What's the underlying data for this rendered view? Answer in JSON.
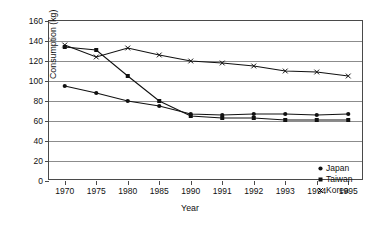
{
  "chart_data": {
    "type": "line",
    "title": "",
    "xlabel": "Year",
    "ylabel": "Consumption (kg)",
    "categories": [
      "1970",
      "1975",
      "1980",
      "1985",
      "1990",
      "1991",
      "1992",
      "1993",
      "1994",
      "1995"
    ],
    "ylim": [
      0,
      160
    ],
    "yticks": [
      0,
      20,
      40,
      60,
      80,
      100,
      120,
      140,
      160
    ],
    "grid": true,
    "legend_position": "inside-bottom-right",
    "series": [
      {
        "name": "Japan",
        "marker": "circle",
        "values": [
          95,
          88,
          80,
          75,
          67,
          66,
          67,
          67,
          66,
          67
        ]
      },
      {
        "name": "Taiwan",
        "marker": "square",
        "values": [
          134,
          131,
          105,
          80,
          65,
          63,
          63,
          61,
          61,
          61
        ]
      },
      {
        "name": "Korea",
        "marker": "cross",
        "values": [
          136,
          124,
          133,
          126,
          120,
          118,
          115,
          110,
          109,
          105
        ]
      }
    ]
  },
  "axis": {
    "y_tick_labels": [
      "0",
      "20",
      "40",
      "60",
      "80",
      "100",
      "120",
      "140",
      "160"
    ],
    "x_tick_labels": [
      "1970",
      "1975",
      "1980",
      "1985",
      "1990",
      "1991",
      "1992",
      "1993",
      "1994",
      "1995"
    ],
    "x_title": "Year",
    "y_title": "Consumption (kg)"
  },
  "legend": {
    "items": [
      {
        "label": "Japan",
        "glyph": "circle-marker-icon"
      },
      {
        "label": "Taiwan",
        "glyph": "square-marker-icon"
      },
      {
        "label": "Korea",
        "glyph": "cross-marker-icon"
      }
    ]
  },
  "colors": {
    "series": "#111111",
    "grid": "#8c8c8c",
    "frame": "#4a4a4a",
    "background": "#ffffff"
  }
}
